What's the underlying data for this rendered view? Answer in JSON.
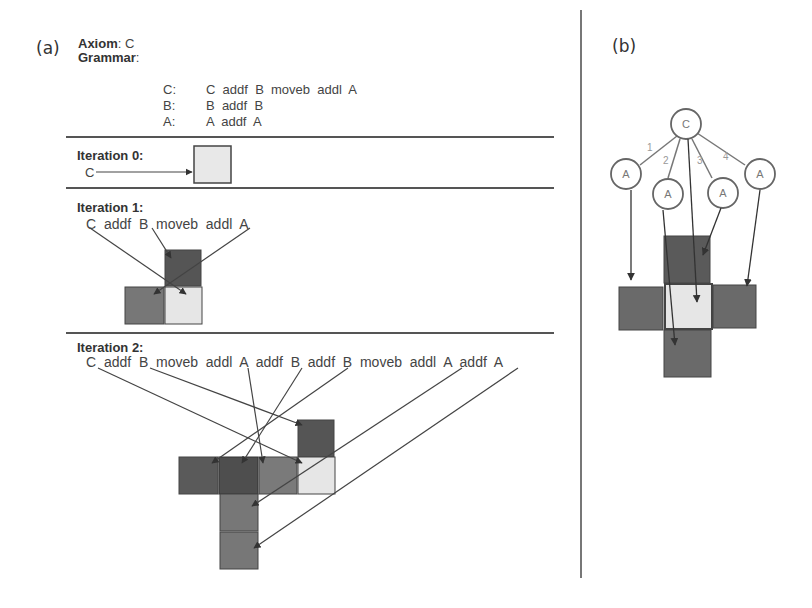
{
  "panel_a": {
    "label": "(a)",
    "axiom": {
      "label": "Axiom",
      "sep": ":",
      "value": " C"
    },
    "grammar": {
      "label": "Grammar",
      "sep": ":",
      "rules": [
        {
          "lhs": "C:",
          "rhs": "C  addf  B  moveb  addl  A"
        },
        {
          "lhs": "B:",
          "rhs": "B  addf  B"
        },
        {
          "lhs": "A:",
          "rhs": "A  addf  A"
        }
      ]
    },
    "iterations": [
      {
        "title": "Iteration 0:",
        "string": "C"
      },
      {
        "title": "Iteration 1:",
        "string": "C  addf  B  moveb  addl  A"
      },
      {
        "title": "Iteration 2:",
        "string": "C  addf  B  moveb  addl  A  addf  B  addf  B  moveb  addl  A  addf  A"
      }
    ]
  },
  "panel_b": {
    "label": "(b)",
    "root_node": "C",
    "child_nodes": [
      "A",
      "A",
      "A",
      "A"
    ],
    "edge_labels": [
      "1",
      "2",
      "3",
      "4"
    ]
  },
  "colors": {
    "light_cell": "#e6e6e6",
    "dark_cell": "#555555",
    "mid_cell": "#7a7a7a",
    "line": "#444444"
  }
}
